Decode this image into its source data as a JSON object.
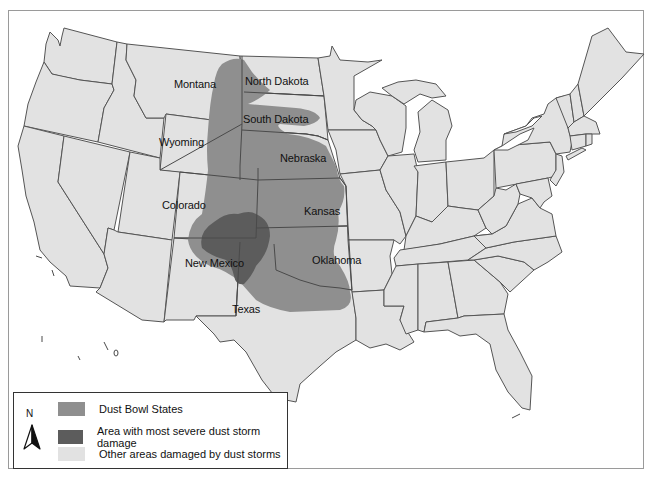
{
  "map": {
    "title": "Dust Bowl map of the United States",
    "colors": {
      "dust_bowl_states": "#8f8f8f",
      "severe_damage": "#5c5c5c",
      "other_areas": "#e2e2e2",
      "water": "#ffffff",
      "border": "#555555"
    },
    "state_labels": [
      {
        "name": "Montana",
        "x": 174,
        "y": 84
      },
      {
        "name": "North Dakota",
        "x": 245,
        "y": 80
      },
      {
        "name": "South Dakota",
        "x": 243,
        "y": 118
      },
      {
        "name": "Wyoming",
        "x": 159,
        "y": 141
      },
      {
        "name": "Nebraska",
        "x": 280,
        "y": 158
      },
      {
        "name": "Colorado",
        "x": 162,
        "y": 204
      },
      {
        "name": "Kansas",
        "x": 304,
        "y": 206
      },
      {
        "name": "New Mexico",
        "x": 185,
        "y": 262
      },
      {
        "name": "Oklahoma",
        "x": 312,
        "y": 258
      },
      {
        "name": "Texas",
        "x": 232,
        "y": 309
      }
    ]
  },
  "legend": {
    "north_label": "N",
    "items": [
      {
        "label": "Dust Bowl States",
        "color": "#8f8f8f"
      },
      {
        "label": "Area with most severe dust storm damage",
        "color": "#5c5c5c"
      },
      {
        "label": "Other areas damaged by dust storms",
        "color": "#e2e2e2"
      }
    ]
  }
}
